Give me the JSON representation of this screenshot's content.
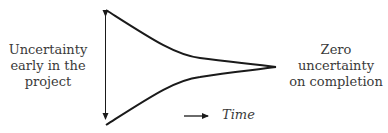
{
  "diagram": {
    "left_label": [
      "Uncertainty",
      "early in the",
      "project"
    ],
    "right_label": [
      "Zero",
      "uncertainty",
      "on completion"
    ],
    "time_label": "Time",
    "colors": {
      "stroke": "#1a1a1a",
      "text": "#3a3a3a",
      "background": "#ffffff"
    }
  }
}
